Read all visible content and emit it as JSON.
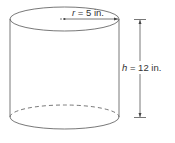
{
  "figure": {
    "shape": "cylinder",
    "radius_label": {
      "variable": "r",
      "equals": " = 5 in."
    },
    "height_label": {
      "variable": "h",
      "equals": " = 12 in."
    },
    "colors": {
      "stroke": "#555555",
      "text": "#333333",
      "background": "#ffffff"
    }
  }
}
